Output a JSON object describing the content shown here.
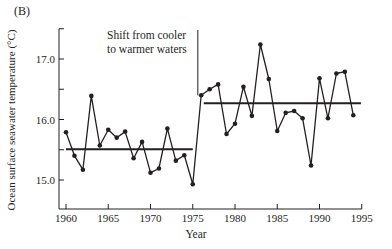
{
  "panel_label": "(B)",
  "annotation": {
    "line1": "Shift from cooler",
    "line2": "to warmer waters"
  },
  "chart_data": {
    "type": "line",
    "title": "",
    "xlabel": "Year",
    "ylabel": "Ocean surface seawater temperature (°C)",
    "xlim": [
      1960,
      1995
    ],
    "ylim": [
      14.5,
      17.5
    ],
    "x_ticks": [
      1960,
      1965,
      1970,
      1975,
      1980,
      1985,
      1990,
      1995
    ],
    "y_ticks": [
      15.0,
      15.5,
      16.0,
      16.5,
      17.0,
      17.5
    ],
    "y_tick_labels": {
      "15": "15.0",
      "16": "16.0",
      "17": "17.0"
    },
    "grid": false,
    "legend": null,
    "series": [
      {
        "name": "Annual ocean surface temperature",
        "x": [
          1960,
          1961,
          1962,
          1963,
          1964,
          1965,
          1966,
          1967,
          1968,
          1969,
          1970,
          1971,
          1972,
          1973,
          1974,
          1975,
          1976,
          1977,
          1978,
          1979,
          1980,
          1981,
          1982,
          1983,
          1984,
          1985,
          1986,
          1987,
          1988,
          1989,
          1990,
          1991,
          1992,
          1993,
          1994
        ],
        "values": [
          15.79,
          15.4,
          15.17,
          16.39,
          15.57,
          15.83,
          15.7,
          15.8,
          15.36,
          15.63,
          15.12,
          15.19,
          15.85,
          15.32,
          15.41,
          14.93,
          16.4,
          16.5,
          16.58,
          15.76,
          15.93,
          16.54,
          16.06,
          17.24,
          16.67,
          15.81,
          16.11,
          16.14,
          16.02,
          15.24,
          16.68,
          16.02,
          16.76,
          16.79,
          16.07
        ]
      }
    ],
    "mean_lines": [
      {
        "name": "Mean 1960-1975",
        "x_start": 1960,
        "x_end": 1975,
        "value": 15.51
      },
      {
        "name": "Mean 1976-1994",
        "x_start": 1976.3,
        "x_end": 1994.9,
        "value": 16.27
      }
    ],
    "regime_shift_line": {
      "x": 1975.6,
      "y_top": 17.48,
      "y_bottom": 16.4
    },
    "annotations": [
      "Shift from cooler to warmer waters"
    ]
  }
}
